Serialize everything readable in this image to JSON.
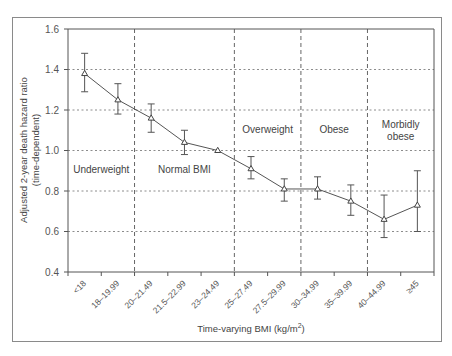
{
  "chart_data": {
    "type": "line",
    "title": "",
    "xlabel": "Time-varying BMI (kg/m²)",
    "ylabel": "Adjusted 2-year death hazard ratio (time-dependent)",
    "ylabel_lines": [
      "Adjusted 2-year death hazard ratio",
      "(time-dependent)"
    ],
    "ylim": [
      0.4,
      1.6
    ],
    "yticks": [
      "0.4",
      "0.6",
      "0.8",
      "1.0",
      "1.2",
      "1.4",
      "1.6"
    ],
    "grid": "horizontal dotted at 0.6–1.4",
    "categories": [
      "<18",
      "18–19.99",
      "20–21.49",
      "21.5–22.99",
      "23–24.49",
      "25–27.49",
      "27.5–29.99",
      "30–34.99",
      "35–39.99",
      "40–44.99",
      "≥45"
    ],
    "series": [
      {
        "name": "Hazard ratio",
        "marker": "triangle",
        "values": [
          1.38,
          1.25,
          1.16,
          1.04,
          1.0,
          0.91,
          0.81,
          0.81,
          0.75,
          0.66,
          0.73
        ],
        "ci_lower": [
          1.29,
          1.18,
          1.09,
          0.98,
          null,
          0.86,
          0.75,
          0.76,
          0.68,
          0.57,
          0.6
        ],
        "ci_upper": [
          1.48,
          1.33,
          1.23,
          1.1,
          null,
          0.97,
          0.86,
          0.87,
          0.83,
          0.78,
          0.9
        ]
      }
    ],
    "regions": [
      {
        "label": "Underweight",
        "from": 0,
        "to": 1
      },
      {
        "label": "Normal BMI",
        "from": 2,
        "to": 4
      },
      {
        "label": "Overweight",
        "from": 5,
        "to": 6
      },
      {
        "label": "Obese",
        "from": 7,
        "to": 8
      },
      {
        "label": "Morbidly obese",
        "from": 9,
        "to": 10
      }
    ],
    "region_label_lines": {
      "Underweight": [
        "Underweight"
      ],
      "Normal BMI": [
        "Normal BMI"
      ],
      "Overweight": [
        "Overweight"
      ],
      "Obese": [
        "Obese"
      ],
      "Morbidly obese": [
        "Morbidly",
        "obese"
      ]
    }
  },
  "labels": {
    "ylabel_line1": "Adjusted 2-year death hazard ratio",
    "ylabel_line2": "(time-dependent)",
    "xlabel_main": "Time-varying BMI (kg/m",
    "xlabel_sup": "2",
    "xlabel_end": ")"
  }
}
